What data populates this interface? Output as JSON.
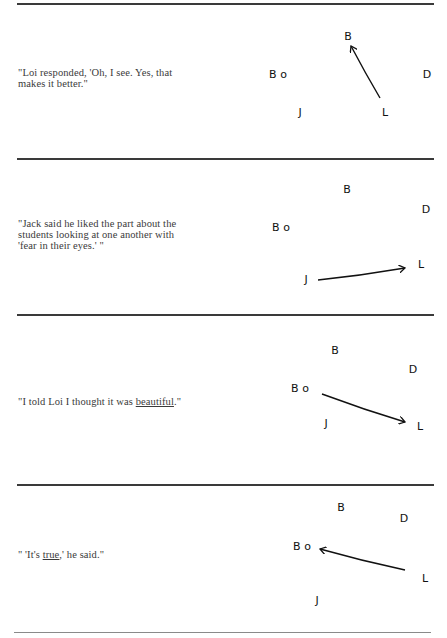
{
  "sections": [
    {
      "quote_parts": [
        {
          "text": "\"Loi responded, 'Oh, I see. Yes, that makes it better.\"",
          "underline": false
        }
      ],
      "nodes": {
        "B": {
          "label": "B",
          "x": 98,
          "y": 24
        },
        "Bo": {
          "label": "Bo",
          "x": 28,
          "y": 62
        },
        "D": {
          "label": "D",
          "x": 177,
          "y": 62
        },
        "J": {
          "label": "J",
          "x": 50,
          "y": 100
        },
        "L": {
          "label": "L",
          "x": 135,
          "y": 100
        }
      },
      "arrow": {
        "from": "L",
        "to": "B",
        "x1": 130,
        "y1": 82,
        "x2": 101,
        "y2": 30
      }
    },
    {
      "quote_parts": [
        {
          "text": "\"Jack said he liked the part about the students looking at one another with 'fear in their eyes.' \"",
          "underline": false
        }
      ],
      "nodes": {
        "B": {
          "label": "B",
          "x": 97,
          "y": 26
        },
        "D": {
          "label": "D",
          "x": 176,
          "y": 46
        },
        "Bo": {
          "label": "Bo",
          "x": 31,
          "y": 64
        },
        "L": {
          "label": "L",
          "x": 171,
          "y": 101
        },
        "J": {
          "label": "J",
          "x": 56,
          "y": 116
        }
      },
      "arrow": {
        "from": "J",
        "to": "L",
        "x1": 68,
        "y1": 113,
        "x2": 155,
        "y2": 101
      }
    },
    {
      "quote_parts": [
        {
          "text": "\"I told Loi I thought it was ",
          "underline": false
        },
        {
          "text": "beautiful",
          "underline": true
        },
        {
          "text": ".\"",
          "underline": false
        }
      ],
      "nodes": {
        "B": {
          "label": "B",
          "x": 85,
          "y": 29
        },
        "D": {
          "label": "D",
          "x": 163,
          "y": 48
        },
        "Bo": {
          "label": "Bo",
          "x": 50,
          "y": 67
        },
        "J": {
          "label": "J",
          "x": 76,
          "y": 102
        },
        "L": {
          "label": "L",
          "x": 170,
          "y": 105
        }
      },
      "arrow": {
        "from": "Bo",
        "to": "L",
        "x1": 72,
        "y1": 69,
        "x2": 155,
        "y2": 97
      }
    },
    {
      "quote_parts": [
        {
          "text": "\" 'It's ",
          "underline": false
        },
        {
          "text": "true",
          "underline": true
        },
        {
          "text": ",' he said.\"",
          "underline": false
        }
      ],
      "nodes": {
        "B": {
          "label": "B",
          "x": 91,
          "y": 26
        },
        "D": {
          "label": "D",
          "x": 154,
          "y": 37
        },
        "Bo": {
          "label": "Bo",
          "x": 52,
          "y": 65
        },
        "L": {
          "label": "L",
          "x": 175,
          "y": 97
        },
        "J": {
          "label": "J",
          "x": 67,
          "y": 119
        }
      },
      "arrow": {
        "from": "L",
        "to": "Bo",
        "x1": 155,
        "y1": 85,
        "x2": 70,
        "y2": 64
      }
    }
  ],
  "colors": {
    "ink": "#111111",
    "text": "#3a3a3a",
    "rule": "#3a3a3a"
  }
}
